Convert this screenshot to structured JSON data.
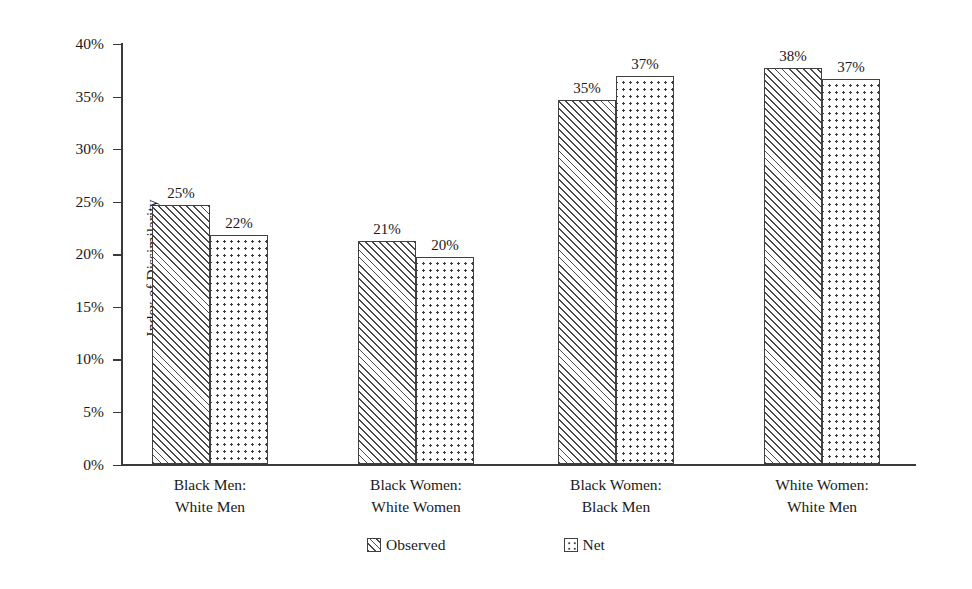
{
  "chart_data": {
    "type": "bar",
    "title": "",
    "xlabel": "",
    "ylabel": "Index of Dissimilarity",
    "ylim": [
      0,
      40
    ],
    "grid": false,
    "legend_position": "bottom-center",
    "categories": [
      "Black Men:\nWhite Men",
      "Black Women:\nWhite Women",
      "Black Women:\nBlack Men",
      "White Women:\nWhite Men"
    ],
    "category_lines": [
      {
        "line1": "Black Men:",
        "line2": "White Men"
      },
      {
        "line1": "Black Women:",
        "line2": "White Women"
      },
      {
        "line1": "Black Women:",
        "line2": "Black Men"
      },
      {
        "line1": "White Women:",
        "line2": "White Men"
      }
    ],
    "series": [
      {
        "name": "Observed",
        "pattern": "diagonal-hatch",
        "values": [
          24.7,
          21.3,
          34.7,
          37.7
        ],
        "labels": [
          "25%",
          "21%",
          "35%",
          "38%"
        ]
      },
      {
        "name": "Net",
        "pattern": "dotted",
        "values": [
          21.8,
          19.7,
          37.0,
          36.7
        ],
        "labels": [
          "22%",
          "20%",
          "37%",
          "37%"
        ]
      }
    ],
    "y_ticks": [
      0,
      5,
      10,
      15,
      20,
      25,
      30,
      35,
      40
    ],
    "y_tick_labels": [
      "0%",
      "5%",
      "10%",
      "15%",
      "20%",
      "25%",
      "30%",
      "35%",
      "40%"
    ]
  },
  "legend": {
    "items": [
      {
        "label": "Observed",
        "swatch": "diagonal-hatch-swatch"
      },
      {
        "label": "Net",
        "swatch": "dotted-swatch"
      }
    ]
  },
  "colors": {
    "background": "#ffffff",
    "axis": "#3a3a3a",
    "bar_outline": "#404040",
    "hatch": "#4a4a4a",
    "dot": "#3d3d3d",
    "text": "#1a1a1a"
  }
}
